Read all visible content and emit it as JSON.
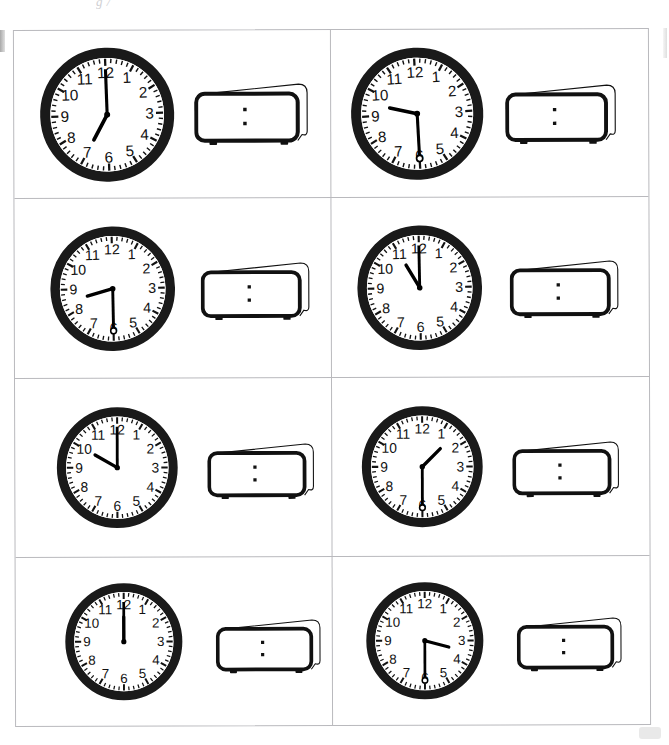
{
  "page": {
    "header_fragment": "g /",
    "grid": {
      "rows": 4,
      "cols": 2,
      "total_cells": 8
    },
    "colors": {
      "bezel": "#1a1a1a",
      "dial": "#ffffff",
      "hand": "#000000",
      "grid_line": "#b9b9bd",
      "page_background": "#ffffff"
    }
  },
  "clock_face": {
    "numerals": [
      "12",
      "1",
      "2",
      "3",
      "4",
      "5",
      "6",
      "7",
      "8",
      "9",
      "10",
      "11"
    ],
    "minute_tick_count": 60,
    "has_hour_ticks": true,
    "digital_separator": ":",
    "digital_value": ""
  },
  "items": [
    {
      "index": 1,
      "position": "row1-left",
      "analog": {
        "hour": 7,
        "minute": 0,
        "time_label": "7:00",
        "hour_angle": 210,
        "minute_angle": 0,
        "has_second_hand": false,
        "hub_style": "solid"
      },
      "digital": {
        "display": "",
        "separator": ":",
        "filled": false
      }
    },
    {
      "index": 2,
      "position": "row1-right",
      "analog": {
        "hour": 9,
        "minute": 30,
        "time_label": "9:30",
        "hour_angle": 285,
        "minute_angle": 180,
        "has_second_hand": false,
        "hub_style": "ring"
      },
      "digital": {
        "display": "",
        "separator": ":",
        "filled": false
      }
    },
    {
      "index": 3,
      "position": "row2-left",
      "analog": {
        "hour": 8,
        "minute": 30,
        "time_label": "8:30",
        "hour_angle": 255,
        "minute_angle": 180,
        "has_second_hand": false,
        "hub_style": "ring"
      },
      "digital": {
        "display": "",
        "separator": ":",
        "filled": false
      }
    },
    {
      "index": 4,
      "position": "row2-right",
      "analog": {
        "hour": 11,
        "minute": 0,
        "time_label": "11:00",
        "hour_angle": 330,
        "minute_angle": 0,
        "has_second_hand": false,
        "hub_style": "solid"
      },
      "digital": {
        "display": "",
        "separator": ":",
        "filled": false
      }
    },
    {
      "index": 5,
      "position": "row3-left",
      "analog": {
        "hour": 10,
        "minute": 0,
        "time_label": "10:00",
        "hour_angle": 300,
        "minute_angle": 0,
        "has_second_hand": false,
        "hub_style": "solid"
      },
      "digital": {
        "display": "",
        "separator": ":",
        "filled": false
      }
    },
    {
      "index": 6,
      "position": "row3-right",
      "analog": {
        "hour": 1,
        "minute": 30,
        "time_label": "1:30",
        "hour_angle": 45,
        "minute_angle": 180,
        "has_second_hand": false,
        "hub_style": "ring"
      },
      "digital": {
        "display": "",
        "separator": ":",
        "filled": false
      }
    },
    {
      "index": 7,
      "position": "row4-left",
      "analog": {
        "hour": 12,
        "minute": 0,
        "time_label": "12:00",
        "hour_angle": 0,
        "minute_angle": 0,
        "has_second_hand": false,
        "hub_style": "solid"
      },
      "digital": {
        "display": "",
        "separator": ":",
        "filled": false
      }
    },
    {
      "index": 8,
      "position": "row4-right",
      "analog": {
        "hour": 3,
        "minute": 30,
        "time_label": "3:30",
        "hour_angle": 105,
        "minute_angle": 180,
        "has_second_hand": false,
        "hub_style": "ring"
      },
      "digital": {
        "display": "",
        "separator": ":",
        "filled": false
      }
    }
  ]
}
